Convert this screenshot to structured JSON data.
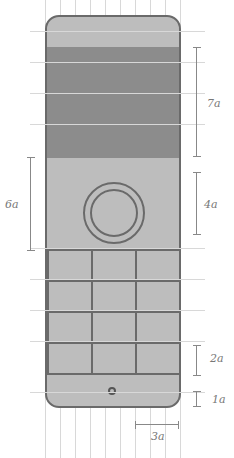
{
  "diagram": {
    "title": "",
    "grid_unit": "a",
    "colors": {
      "body": "#bdbdbd",
      "screen": "#8c8c8c",
      "outline": "#6a6a6a",
      "grid": "#d8d8d8"
    },
    "dimensions": {
      "screen_height": "7a",
      "control_zone_height": "6a",
      "ring_diameter": "4a",
      "key_height": "2a",
      "bottom_margin": "1a",
      "key_width": "3a"
    },
    "keypad": {
      "rows": 4,
      "cols": 3
    }
  }
}
